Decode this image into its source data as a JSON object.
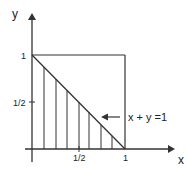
{
  "diagram": {
    "type": "region-plot",
    "axes": {
      "x_label": "x",
      "y_label": "y",
      "x_ticks": [
        "1/2",
        "1"
      ],
      "y_ticks": [
        "1/2",
        "1"
      ]
    },
    "annotation": {
      "text": "x + y =1",
      "points_to": "line x + y = 1"
    },
    "shaded_region": "triangle bounded by x=0, y=0, x+y=1 (vertical hatching)",
    "box": "unit square [0,1]x[0,1]",
    "hatch_line_count": 7,
    "colors": {
      "stroke": "#333333",
      "background": "#ffffff"
    }
  }
}
